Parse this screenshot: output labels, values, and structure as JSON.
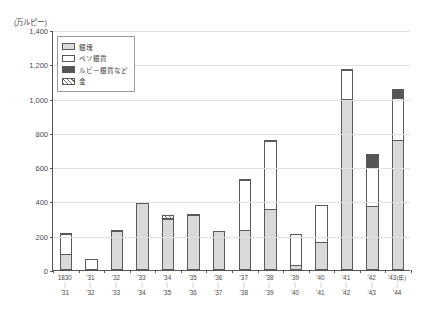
{
  "chart_data": {
    "type": "bar",
    "stacked": true,
    "title": "",
    "xlabel": "(年)",
    "ylabel": "(万ルピー)",
    "ylim": [
      0,
      1400
    ],
    "yticks": [
      0,
      200,
      400,
      600,
      800,
      1000,
      1200,
      1400
    ],
    "ytick_labels": [
      "0",
      "200",
      "400",
      "600",
      "800",
      "1,000",
      "1,200",
      "1,400"
    ],
    "grid": true,
    "legend_position": "upper-left-inside",
    "categories": [
      "1830\n｜\n'31",
      "'31\n｜\n'32",
      "'32\n｜\n'33",
      "'33\n｜\n'34",
      "'34\n｜\n'35",
      "'35\n｜\n'36",
      "'36\n｜\n'37",
      "'37\n｜\n'38",
      "'38\n｜\n'39",
      "'39\n｜\n'40",
      "'40\n｜\n'41",
      "'41\n｜\n'42",
      "'42\n｜\n'43",
      "'43\n｜\n'44"
    ],
    "series": [
      {
        "name": "銀塊",
        "key": "ingot",
        "values": [
          95,
          0,
          230,
          390,
          295,
          320,
          225,
          235,
          355,
          30,
          165,
          1000,
          375,
          760
        ]
      },
      {
        "name": "ペソ銀貨",
        "key": "peso",
        "values": [
          120,
          65,
          5,
          0,
          15,
          10,
          0,
          295,
          405,
          185,
          220,
          170,
          225,
          250
        ]
      },
      {
        "name": "ルビー銀貨など",
        "key": "ruby",
        "values": [
          0,
          0,
          0,
          15,
          0,
          0,
          0,
          10,
          10,
          0,
          0,
          10,
          90,
          50
        ]
      },
      {
        "name": "金",
        "key": "gold",
        "values": [
          10,
          0,
          5,
          0,
          25,
          8,
          5,
          5,
          5,
          0,
          0,
          8,
          0,
          12
        ]
      }
    ],
    "totals": [
      225,
      65,
      240,
      405,
      335,
      338,
      230,
      545,
      775,
      215,
      385,
      1188,
      690,
      1072
    ]
  },
  "axis": {
    "unit_label": "(万ルピー)",
    "x_suffix": "(年)"
  },
  "legend": {
    "items": [
      {
        "label": "銀塊",
        "swatch": "ingot-swatch"
      },
      {
        "label": "ペソ銀貨",
        "swatch": "peso-swatch"
      },
      {
        "label": "ルビー銀貨など",
        "swatch": "ruby-swatch"
      },
      {
        "label": "金",
        "swatch": "gold-swatch"
      }
    ]
  },
  "xlabels": [
    {
      "top": "1830",
      "dash": "｜",
      "bottom": "'31",
      "suffix": ""
    },
    {
      "top": "'31",
      "dash": "｜",
      "bottom": "'32",
      "suffix": ""
    },
    {
      "top": "'32",
      "dash": "｜",
      "bottom": "'33",
      "suffix": ""
    },
    {
      "top": "'33",
      "dash": "｜",
      "bottom": "'34",
      "suffix": ""
    },
    {
      "top": "'34",
      "dash": "｜",
      "bottom": "'35",
      "suffix": ""
    },
    {
      "top": "'35",
      "dash": "｜",
      "bottom": "'36",
      "suffix": ""
    },
    {
      "top": "'36",
      "dash": "｜",
      "bottom": "'37",
      "suffix": ""
    },
    {
      "top": "'37",
      "dash": "｜",
      "bottom": "'38",
      "suffix": ""
    },
    {
      "top": "'38",
      "dash": "｜",
      "bottom": "'39",
      "suffix": ""
    },
    {
      "top": "'39",
      "dash": "｜",
      "bottom": "'40",
      "suffix": ""
    },
    {
      "top": "'40",
      "dash": "｜",
      "bottom": "'41",
      "suffix": ""
    },
    {
      "top": "'41",
      "dash": "｜",
      "bottom": "'42",
      "suffix": ""
    },
    {
      "top": "'42",
      "dash": "｜",
      "bottom": "'43",
      "suffix": ""
    },
    {
      "top": "'43",
      "dash": "｜",
      "bottom": "'44",
      "suffix": "(年)"
    }
  ],
  "caption": "",
  "colors": {
    "ingot": "#d9d9d9",
    "peso": "#ffffff",
    "ruby": "#555555",
    "gold": "#6f6f6f",
    "axis": "#555555",
    "grid": "#e2e2e2"
  }
}
